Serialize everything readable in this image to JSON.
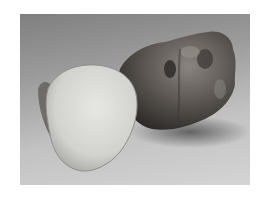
{
  "image": {
    "description": "Grayscale photograph of a Jerusalem artichoke (sunchoke): one whole knobby tuber and one cut in half showing pale flesh",
    "subjects": [
      {
        "name": "whole-tuber",
        "tone": "#5a5550"
      },
      {
        "name": "halved-tuber-flesh",
        "tone": "#d9d9d6"
      }
    ],
    "background": {
      "top": "#7f7f7f",
      "bottom": "#d4d4d4"
    },
    "border_color": "#ffffff"
  }
}
